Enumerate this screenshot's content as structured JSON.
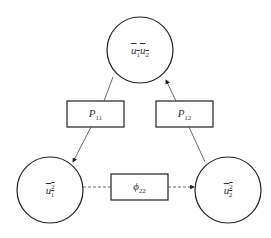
{
  "diagram": {
    "nodes": [
      {
        "id": "top",
        "base": "u",
        "label": "u₁u₂",
        "a": "1",
        "b": "2"
      },
      {
        "id": "left",
        "base": "u",
        "sub": "1",
        "sup": "2"
      },
      {
        "id": "right",
        "base": "u",
        "sub": "2",
        "sup": "2"
      }
    ],
    "boxes": [
      {
        "id": "p11",
        "symbol": "P",
        "sub": "11"
      },
      {
        "id": "p12",
        "symbol": "P",
        "sub": "12"
      },
      {
        "id": "phi22",
        "symbol": "ϕ",
        "sub": "22"
      }
    ],
    "edges": [
      {
        "from": "top",
        "to": "left",
        "via": "p11",
        "style": "solid"
      },
      {
        "from": "right",
        "to": "top",
        "via": "p12",
        "style": "solid"
      },
      {
        "from": "left",
        "to": "right",
        "via": "phi22",
        "style": "dashed"
      }
    ],
    "colors": {
      "stroke": "#222222",
      "background": "#ffffff"
    }
  }
}
